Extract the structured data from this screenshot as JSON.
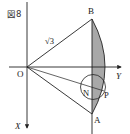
{
  "figure": {
    "caption": "図8",
    "labels": {
      "origin": "O",
      "point_b": "B",
      "point_a": "A",
      "point_n": "N",
      "point_p": "P",
      "x_axis": "X",
      "y_axis": "Y",
      "radius": "√3"
    },
    "colors": {
      "line": "#222222",
      "shade": "#a8a8a8",
      "background": "#ffffff"
    }
  }
}
